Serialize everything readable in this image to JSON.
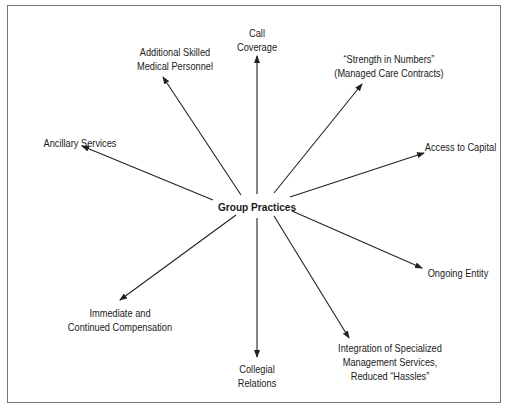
{
  "figure": {
    "title_partial": "Figure  ...  Group Practice Advantages",
    "center_node": "Group Practices",
    "nodes": [
      {
        "id": "call-coverage",
        "lines": [
          "Call",
          "Coverage"
        ]
      },
      {
        "id": "additional-skilled-medical-personnel",
        "lines": [
          "Additional Skilled",
          "Medical Personnel"
        ]
      },
      {
        "id": "strength-in-numbers",
        "lines": [
          "“Strength in Numbers”",
          "(Managed Care Contracts)"
        ]
      },
      {
        "id": "ancillary-services",
        "lines": [
          "Ancillary Services"
        ]
      },
      {
        "id": "access-to-capital",
        "lines": [
          "Access to Capital"
        ]
      },
      {
        "id": "ongoing-entity",
        "lines": [
          "Ongoing Entity"
        ]
      },
      {
        "id": "immediate-continued-compensation",
        "lines": [
          "Immediate and",
          "Continued Compensation"
        ]
      },
      {
        "id": "collegial-relations",
        "lines": [
          "Collegial",
          "Relations"
        ]
      },
      {
        "id": "integration-management-services",
        "lines": [
          "Integration of Specialized",
          "Management Services,",
          "Reduced “Hassles”"
        ]
      }
    ],
    "colors": {
      "line": "#222222",
      "frame": "#777777",
      "text": "#1a1a1a"
    }
  }
}
